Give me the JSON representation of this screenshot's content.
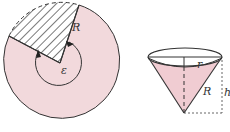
{
  "diagram": {
    "left_figure": {
      "description": "Circular disc with a sector cut out (hatched), leaving angle epsilon",
      "labels": {
        "radius": "R",
        "angle": "ε"
      }
    },
    "right_figure": {
      "description": "Cone formed by rolling the remaining sector",
      "labels": {
        "base_radius": "r",
        "slant": "R",
        "height": "h"
      }
    },
    "colors": {
      "fill": "#f2d9dc",
      "stroke": "#333333",
      "cone_fill": "#f0ccd2"
    }
  }
}
